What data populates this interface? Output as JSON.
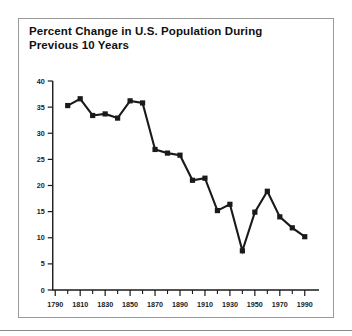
{
  "figure": {
    "title_line1": "Percent Change in U.S. Population During",
    "title_line2": "Previous 10 Years",
    "border_color": "#9a9a9a",
    "ink_color": "#1a1a1a",
    "background": "#ffffff"
  },
  "chart_data": {
    "type": "line",
    "title": "Percent Change in U.S. Population During Previous 10 Years",
    "xlabel": "",
    "ylabel": "",
    "xlim": [
      1785,
      1995
    ],
    "ylim": [
      0,
      40
    ],
    "grid": false,
    "legend": null,
    "marker": "square",
    "x": [
      1790,
      1800,
      1810,
      1820,
      1830,
      1840,
      1850,
      1860,
      1870,
      1880,
      1890,
      1900,
      1910,
      1920,
      1930,
      1940,
      1950,
      1960,
      1970,
      1980,
      1990
    ],
    "values": [
      null,
      35.3,
      36.6,
      33.4,
      33.7,
      32.9,
      36.2,
      35.8,
      26.9,
      26.2,
      25.8,
      21.0,
      21.4,
      15.2,
      16.4,
      7.5,
      14.9,
      18.9,
      14.0,
      11.9,
      10.2
    ],
    "x_tick_labels": [
      "1790",
      "1810",
      "1830",
      "1850",
      "1870",
      "1890",
      "1910",
      "1930",
      "1950",
      "1970",
      "1990"
    ],
    "x_tick_values": [
      1790,
      1810,
      1830,
      1850,
      1870,
      1890,
      1910,
      1930,
      1950,
      1970,
      1990
    ],
    "x_minor_ticks": [
      1800,
      1820,
      1840,
      1860,
      1880,
      1900,
      1920,
      1940,
      1960,
      1980
    ],
    "y_tick_labels": [
      "0",
      "5",
      "10",
      "15",
      "20",
      "25",
      "30",
      "35",
      "40"
    ],
    "y_tick_values": [
      0,
      5,
      10,
      15,
      20,
      25,
      30,
      35,
      40
    ],
    "series": [
      {
        "name": "Percent change in U.S. population",
        "points": [
          {
            "x": 1800,
            "y": 35.3
          },
          {
            "x": 1810,
            "y": 36.6
          },
          {
            "x": 1820,
            "y": 33.4
          },
          {
            "x": 1830,
            "y": 33.7
          },
          {
            "x": 1840,
            "y": 32.9
          },
          {
            "x": 1850,
            "y": 36.2
          },
          {
            "x": 1860,
            "y": 35.8
          },
          {
            "x": 1870,
            "y": 26.9
          },
          {
            "x": 1880,
            "y": 26.2
          },
          {
            "x": 1890,
            "y": 25.8
          },
          {
            "x": 1900,
            "y": 21.0
          },
          {
            "x": 1910,
            "y": 21.4
          },
          {
            "x": 1920,
            "y": 15.2
          },
          {
            "x": 1930,
            "y": 16.4
          },
          {
            "x": 1940,
            "y": 7.5
          },
          {
            "x": 1950,
            "y": 14.9
          },
          {
            "x": 1960,
            "y": 18.9
          },
          {
            "x": 1970,
            "y": 14.0
          },
          {
            "x": 1980,
            "y": 11.9
          },
          {
            "x": 1990,
            "y": 10.2
          }
        ]
      }
    ]
  }
}
